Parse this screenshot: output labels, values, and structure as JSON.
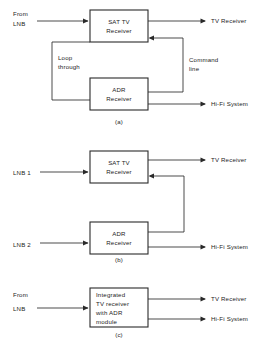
{
  "figure": {
    "background_color": "#ffffff",
    "line_color": "#2a2a2a",
    "text_color": "#1c1c1c"
  },
  "diagrams": [
    {
      "id": "a",
      "caption": "(a)",
      "blocks": [
        {
          "name": "sat-tv-receiver",
          "line1": "SAT   TV",
          "line2": "Receiver"
        },
        {
          "name": "adr-receiver",
          "line1": "ADR",
          "line2": "Receiver"
        }
      ],
      "inputs": [
        {
          "name": "from-lnb",
          "line1": "From",
          "line2": "LNB"
        }
      ],
      "outputs": [
        {
          "name": "tv-receiver-output",
          "label": "TV   Receiver"
        },
        {
          "name": "hifi-system-output",
          "label": "Hi-Fi System"
        }
      ],
      "wire_labels": [
        {
          "name": "loop-through",
          "line1": "Loop",
          "line2": "through"
        },
        {
          "name": "command-line",
          "line1": "Command",
          "line2": "line"
        }
      ]
    },
    {
      "id": "b",
      "caption": "(b)",
      "blocks": [
        {
          "name": "sat-tv-receiver",
          "line1": "SAT   TV",
          "line2": "Receiver"
        },
        {
          "name": "adr-receiver",
          "line1": "ADR",
          "line2": "Receiver"
        }
      ],
      "inputs": [
        {
          "name": "lnb-1",
          "label": "LNB 1"
        },
        {
          "name": "lnb-2",
          "label": "LNB 2"
        }
      ],
      "outputs": [
        {
          "name": "tv-receiver-output",
          "label": "TV   Receiver"
        },
        {
          "name": "hifi-system-output",
          "label": "Hi-Fi System"
        }
      ],
      "wire_labels": []
    },
    {
      "id": "c",
      "caption": "(c)",
      "blocks": [
        {
          "name": "integrated-receiver",
          "line1": "Integrated",
          "line2": "TV receiver",
          "line3": "with ADR",
          "line4": "module"
        }
      ],
      "inputs": [
        {
          "name": "from-lnb",
          "line1": "From",
          "line2": "LNB"
        }
      ],
      "outputs": [
        {
          "name": "tv-receiver-output",
          "label": "TV   Receiver"
        },
        {
          "name": "hifi-system-output",
          "label": "Hi-Fi System"
        }
      ],
      "wire_labels": []
    }
  ]
}
